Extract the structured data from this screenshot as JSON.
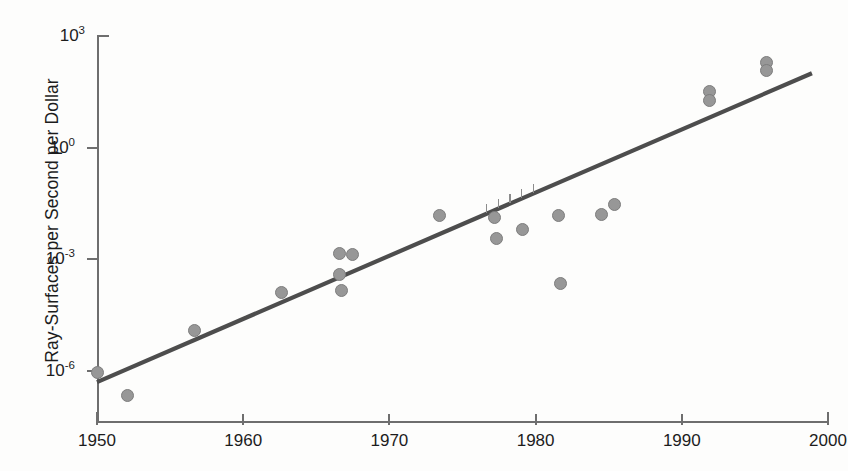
{
  "chart_data": {
    "type": "scatter",
    "title": "",
    "xlabel": "",
    "ylabel": "Ray-Surfaces per Second per Dollar",
    "xlim": [
      1950,
      2000
    ],
    "ylim_log10": [
      -7.4,
      3.0
    ],
    "yscale": "log",
    "grid": false,
    "legend": "none",
    "xticks": [
      "1950",
      "1960",
      "1970",
      "1980",
      "1990",
      "2000"
    ],
    "xtick_values": [
      1950,
      1960,
      1970,
      1980,
      1990,
      2000
    ],
    "yticks": [
      "10^3",
      "10^0",
      "10^-3",
      "10^-6"
    ],
    "ytick_exponents": [
      3,
      0,
      -3,
      -6
    ],
    "ytick_mantissa": "10",
    "series": [
      {
        "name": "Ray-surfaces per second per dollar",
        "marker": "filled-circle",
        "color": "#979797",
        "points": [
          {
            "x": 1950.0,
            "y_log10": -6.05
          },
          {
            "x": 1952.1,
            "y_log10": -6.67
          },
          {
            "x": 1956.7,
            "y_log10": -4.91
          },
          {
            "x": 1962.6,
            "y_log10": -3.89
          },
          {
            "x": 1966.6,
            "y_log10": -2.85
          },
          {
            "x": 1967.5,
            "y_log10": -2.88
          },
          {
            "x": 1966.6,
            "y_log10": -3.41
          },
          {
            "x": 1966.7,
            "y_log10": -3.85
          },
          {
            "x": 1973.4,
            "y_log10": -1.83
          },
          {
            "x": 1977.2,
            "y_log10": -1.88
          },
          {
            "x": 1977.3,
            "y_log10": -2.43
          },
          {
            "x": 1979.1,
            "y_log10": -2.19
          },
          {
            "x": 1981.6,
            "y_log10": -1.82
          },
          {
            "x": 1981.7,
            "y_log10": -3.65
          },
          {
            "x": 1984.5,
            "y_log10": -1.8
          },
          {
            "x": 1985.4,
            "y_log10": -1.54
          },
          {
            "x": 1991.9,
            "y_log10": 1.52
          },
          {
            "x": 1991.9,
            "y_log10": 1.28
          },
          {
            "x": 1995.8,
            "y_log10": 2.3
          },
          {
            "x": 1995.8,
            "y_log10": 2.06
          }
        ]
      }
    ],
    "trendline": {
      "name": "fit-line",
      "color": "#4d4d4d",
      "x_start": 1950.0,
      "y_log10_start": -6.3,
      "x_end": 1998.9,
      "y_log10_end": 2.0
    }
  }
}
